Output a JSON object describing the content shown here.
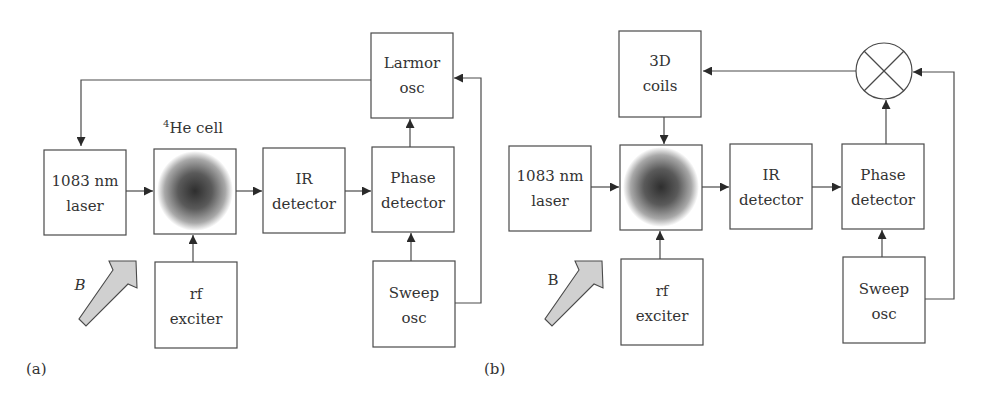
{
  "figure": {
    "panel_a": {
      "caption": "(a)",
      "cell_label_sup": "4",
      "cell_label": "He cell",
      "field_label": "B",
      "blocks": {
        "laser": [
          "1083 nm",
          "laser"
        ],
        "ir_detector": [
          "IR",
          "detector"
        ],
        "phase_detector": [
          "Phase",
          "detector"
        ],
        "larmor_osc": [
          "Larmor",
          "osc"
        ],
        "rf_exciter": [
          "rf",
          "exciter"
        ],
        "sweep_osc": [
          "Sweep",
          "osc"
        ]
      }
    },
    "panel_b": {
      "caption": "(b)",
      "field_label": "B",
      "blocks": {
        "laser": [
          "1083 nm",
          "laser"
        ],
        "coils": [
          "3D",
          "coils"
        ],
        "ir_detector": [
          "IR",
          "detector"
        ],
        "phase_detector": [
          "Phase",
          "detector"
        ],
        "rf_exciter": [
          "rf",
          "exciter"
        ],
        "sweep_osc": [
          "Sweep",
          "osc"
        ]
      },
      "mixer_symbol": "multiplier"
    },
    "colors": {
      "line": "#4a4a4a",
      "text": "#333333",
      "arrow_fill": "#d0d0d0",
      "cell_center": "#3a3a3a"
    }
  }
}
